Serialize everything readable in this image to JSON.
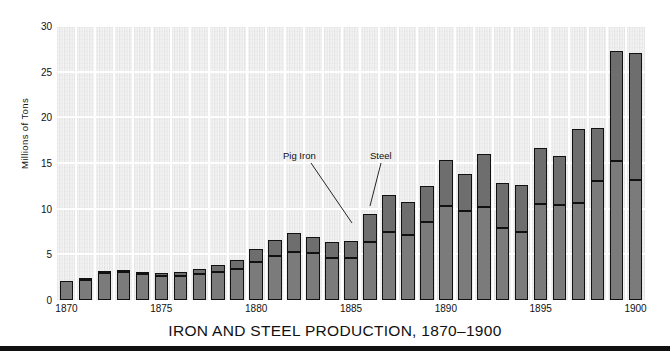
{
  "chart_data": {
    "type": "bar",
    "stacked": true,
    "title": "IRON AND STEEL PRODUCTION, 1870–1900",
    "xlabel": "",
    "ylabel": "Millions of Tons",
    "ylim": [
      0,
      30
    ],
    "yticks": [
      0,
      5,
      10,
      15,
      20,
      25,
      30
    ],
    "ytick_labels": [
      "0",
      "5",
      "10",
      "15",
      "20",
      "25",
      "30"
    ],
    "xlim": [
      1870,
      1900
    ],
    "xticks": [
      1870,
      1875,
      1880,
      1885,
      1890,
      1895,
      1900
    ],
    "xtick_labels": [
      "1870",
      "1875",
      "1880",
      "1885",
      "1890",
      "1895",
      "1900"
    ],
    "grid": "white gridlines, horizontal at every 5 units and vertical at every year",
    "legend": "inline annotations with leader lines",
    "annotations": [
      {
        "text": "Pig Iron",
        "points_to_series": "Pig Iron",
        "points_to_year": 1886
      },
      {
        "text": "Steel",
        "points_to_series": "Steel",
        "points_to_year": 1886
      }
    ],
    "categories": [
      1870,
      1871,
      1872,
      1873,
      1874,
      1875,
      1876,
      1877,
      1878,
      1879,
      1880,
      1881,
      1882,
      1883,
      1884,
      1885,
      1886,
      1887,
      1888,
      1889,
      1890,
      1891,
      1892,
      1893,
      1894,
      1895,
      1896,
      1897,
      1898,
      1899,
      1900
    ],
    "series": [
      {
        "name": "Pig Iron",
        "color": "#7b7b7b",
        "values": [
          2.1,
          2.2,
          3.0,
          3.1,
          2.8,
          2.6,
          2.6,
          2.8,
          3.1,
          3.4,
          4.2,
          4.8,
          5.3,
          5.2,
          4.6,
          4.6,
          6.4,
          7.5,
          7.1,
          8.5,
          10.3,
          9.8,
          10.2,
          7.9,
          7.5,
          10.5,
          10.4,
          10.6,
          13.0,
          15.2,
          13.1
        ]
      },
      {
        "name": "Steel",
        "color": "#6e6e6e",
        "values": [
          0.0,
          0.1,
          0.2,
          0.1,
          0.2,
          0.4,
          0.5,
          0.6,
          0.7,
          1.0,
          1.4,
          1.8,
          2.0,
          1.7,
          1.7,
          1.9,
          3.0,
          4.0,
          3.6,
          4.0,
          5.0,
          4.0,
          5.8,
          4.9,
          5.1,
          6.1,
          5.4,
          8.1,
          5.8,
          12.1,
          13.9
        ]
      }
    ]
  },
  "axes": {
    "ylabel": "Millions of Tons"
  },
  "title": "IRON AND STEEL PRODUCTION, 1870–1900",
  "annotations": {
    "pig_iron": "Pig Iron",
    "steel": "Steel"
  },
  "colors": {
    "plot_background": "#e9e9e9",
    "gridline": "#ffffff",
    "pig_iron": "#7b7b7b",
    "steel": "#6e6e6e",
    "outline": "#111111",
    "page_background": "#ffffff"
  }
}
